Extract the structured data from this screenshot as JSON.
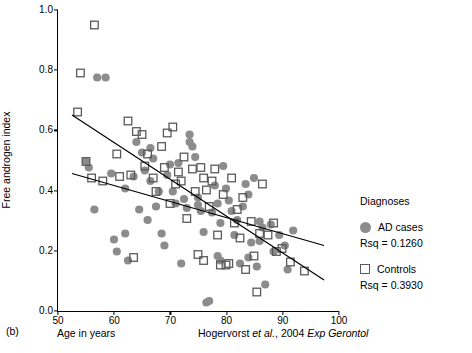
{
  "panel": {
    "letter": "(b)"
  },
  "citation": {
    "authors": "Hogervorst ",
    "etal": "et al.",
    "year": ", 2004 ",
    "journal": "Exp Gerontol"
  },
  "legend": {
    "title": "Diagnoses",
    "entries": [
      {
        "label": "AD cases",
        "rsq": "Rsq = 0.1260",
        "marker": "filled-circle-icon",
        "color": "#8c8c8c"
      },
      {
        "label": "Controls",
        "rsq": "Rsq = 0.3930",
        "marker": "open-square-icon",
        "color": "#5a5a5a"
      }
    ]
  },
  "chart_data": {
    "type": "scatter",
    "title": "",
    "xlabel": "Age in years",
    "ylabel": "Free androgen index",
    "xlim": [
      50,
      100
    ],
    "ylim": [
      0.0,
      1.0
    ],
    "xticks": [
      50,
      60,
      70,
      80,
      90,
      100
    ],
    "yticks": [
      "0.0",
      "0.2",
      "0.4",
      "0.6",
      "0.8",
      "1.0"
    ],
    "grid": false,
    "legend_position": "right",
    "series": [
      {
        "name": "AD cases",
        "marker": "filled-circle",
        "color": "#8c8c8c",
        "rsq": 0.126,
        "fit_line": {
          "x": [
            52.5,
            97.5
          ],
          "y": [
            0.455,
            0.215
          ]
        },
        "points": [
          [
            55.0,
            0.495
          ],
          [
            55.5,
            0.475
          ],
          [
            56.5,
            0.335
          ],
          [
            58.5,
            0.775
          ],
          [
            59.5,
            0.455
          ],
          [
            60.0,
            0.235
          ],
          [
            60.5,
            0.195
          ],
          [
            62.0,
            0.405
          ],
          [
            62.5,
            0.165
          ],
          [
            63.5,
            0.445
          ],
          [
            64.5,
            0.335
          ],
          [
            65.0,
            0.525
          ],
          [
            65.5,
            0.465
          ],
          [
            66.0,
            0.3
          ],
          [
            66.5,
            0.43
          ],
          [
            67.0,
            0.505
          ],
          [
            67.5,
            0.345
          ],
          [
            68.0,
            0.395
          ],
          [
            68.5,
            0.255
          ],
          [
            69.0,
            0.215
          ],
          [
            69.5,
            0.45
          ],
          [
            70.0,
            0.485
          ],
          [
            70.5,
            0.395
          ],
          [
            71.0,
            0.355
          ],
          [
            71.5,
            0.49
          ],
          [
            72.0,
            0.155
          ],
          [
            72.5,
            0.37
          ],
          [
            73.0,
            0.34
          ],
          [
            73.5,
            0.585
          ],
          [
            74.0,
            0.545
          ],
          [
            74.5,
            0.51
          ],
          [
            75.0,
            0.375
          ],
          [
            75.5,
            0.33
          ],
          [
            76.0,
            0.26
          ],
          [
            76.5,
            0.025
          ],
          [
            77.0,
            0.03
          ],
          [
            77.5,
            0.325
          ],
          [
            78.0,
            0.415
          ],
          [
            78.5,
            0.355
          ],
          [
            79.0,
            0.29
          ],
          [
            79.5,
            0.48
          ],
          [
            80.0,
            0.405
          ],
          [
            80.5,
            0.365
          ],
          [
            81.0,
            0.33
          ],
          [
            81.5,
            0.25
          ],
          [
            82.0,
            0.3
          ],
          [
            82.5,
            0.155
          ],
          [
            83.0,
            0.345
          ],
          [
            83.5,
            0.42
          ],
          [
            84.0,
            0.385
          ],
          [
            84.5,
            0.225
          ],
          [
            85.0,
            0.44
          ],
          [
            85.5,
            0.145
          ],
          [
            86.0,
            0.295
          ],
          [
            86.5,
            0.275
          ],
          [
            87.0,
            0.085
          ],
          [
            88.0,
            0.285
          ],
          [
            88.5,
            0.195
          ],
          [
            89.5,
            0.25
          ],
          [
            90.5,
            0.215
          ],
          [
            91.0,
            0.135
          ],
          [
            92.0,
            0.265
          ],
          [
            57.0,
            0.775
          ],
          [
            64.0,
            0.56
          ],
          [
            66.5,
            0.54
          ],
          [
            73.5,
            0.56
          ],
          [
            75.0,
            0.35
          ],
          [
            78.5,
            0.18
          ],
          [
            79.0,
            0.165
          ],
          [
            84.0,
            0.175
          ],
          [
            86.0,
            0.23
          ],
          [
            62.0,
            0.255
          ]
        ]
      },
      {
        "name": "Controls",
        "marker": "open-square",
        "color": "#5a5a5a",
        "rsq": 0.393,
        "fit_line": {
          "x": [
            52.5,
            97.5
          ],
          "y": [
            0.65,
            0.1
          ]
        },
        "points": [
          [
            56.5,
            0.95
          ],
          [
            54.0,
            0.79
          ],
          [
            53.5,
            0.66
          ],
          [
            55.0,
            0.495
          ],
          [
            56.0,
            0.44
          ],
          [
            58.0,
            0.43
          ],
          [
            60.5,
            0.52
          ],
          [
            61.0,
            0.445
          ],
          [
            62.5,
            0.63
          ],
          [
            63.0,
            0.45
          ],
          [
            64.0,
            0.595
          ],
          [
            65.0,
            0.585
          ],
          [
            65.5,
            0.48
          ],
          [
            66.0,
            0.52
          ],
          [
            67.0,
            0.44
          ],
          [
            67.5,
            0.395
          ],
          [
            68.5,
            0.545
          ],
          [
            69.0,
            0.475
          ],
          [
            69.5,
            0.59
          ],
          [
            70.5,
            0.61
          ],
          [
            71.0,
            0.42
          ],
          [
            71.5,
            0.46
          ],
          [
            72.0,
            0.43
          ],
          [
            72.5,
            0.51
          ],
          [
            73.0,
            0.305
          ],
          [
            74.0,
            0.47
          ],
          [
            74.5,
            0.395
          ],
          [
            75.5,
            0.475
          ],
          [
            76.0,
            0.44
          ],
          [
            76.5,
            0.4
          ],
          [
            77.0,
            0.345
          ],
          [
            77.5,
            0.43
          ],
          [
            78.0,
            0.47
          ],
          [
            78.5,
            0.25
          ],
          [
            79.5,
            0.385
          ],
          [
            80.0,
            0.15
          ],
          [
            80.5,
            0.155
          ],
          [
            81.0,
            0.44
          ],
          [
            81.5,
            0.29
          ],
          [
            82.0,
            0.335
          ],
          [
            82.5,
            0.24
          ],
          [
            83.0,
            0.375
          ],
          [
            83.5,
            0.135
          ],
          [
            84.5,
            0.295
          ],
          [
            85.0,
            0.18
          ],
          [
            86.0,
            0.255
          ],
          [
            86.5,
            0.42
          ],
          [
            87.5,
            0.25
          ],
          [
            88.5,
            0.29
          ],
          [
            89.0,
            0.195
          ],
          [
            90.0,
            0.205
          ],
          [
            91.5,
            0.16
          ],
          [
            94.0,
            0.13
          ],
          [
            63.5,
            0.175
          ],
          [
            70.0,
            0.355
          ],
          [
            75.0,
            0.185
          ],
          [
            76.0,
            0.165
          ],
          [
            79.0,
            0.15
          ],
          [
            85.5,
            0.06
          ]
        ]
      }
    ]
  }
}
